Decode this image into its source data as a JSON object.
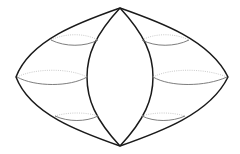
{
  "diagram": {
    "colors": {
      "outline": "#1a1a1a",
      "front_curve": "#6e6e6e",
      "back_curve": "#c4c4c4",
      "background": "#ffffff"
    },
    "vertices": {
      "top": [
        120,
        8
      ],
      "bottom": [
        120,
        146
      ],
      "left": [
        16,
        77
      ],
      "right": [
        228,
        77
      ]
    },
    "inner_lens": {
      "left_x": 87,
      "right_x": 153
    },
    "bands": [
      "upper",
      "middle",
      "lower"
    ]
  }
}
